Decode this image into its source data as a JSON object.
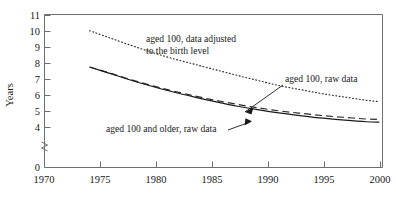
{
  "chart_data": {
    "type": "line",
    "title": "",
    "xlabel": "",
    "ylabel": "Years",
    "xlim": [
      1970,
      2001.5
    ],
    "ylim": [
      3.6,
      11.3
    ],
    "y_axis_break": true,
    "y_break_between": [
      0,
      4
    ],
    "grid": false,
    "legend_position": "inline-annotations",
    "xticks": [
      1970,
      1975,
      1980,
      1985,
      1990,
      1995,
      2000
    ],
    "xtick_labels": [
      "1970",
      "1975",
      "1980",
      "1985",
      "1990",
      "1995",
      "2000"
    ],
    "yticks": [
      0,
      4,
      5,
      6,
      7,
      8,
      9,
      10,
      11
    ],
    "ytick_labels": [
      "0",
      "4",
      "5",
      "6",
      "7",
      "8",
      "9",
      "10",
      "11"
    ],
    "series": [
      {
        "name": "aged 100, data adjusted to the birth level",
        "style": "dotted",
        "x": [
          1974.2,
          1976,
          1978,
          1980,
          1982,
          1984,
          1986,
          1988,
          1990,
          1992,
          1994,
          1996,
          1998,
          2000,
          2001.2
        ],
        "values": [
          10.05,
          9.62,
          9.15,
          8.7,
          8.3,
          7.95,
          7.6,
          7.25,
          6.92,
          6.6,
          6.35,
          6.1,
          5.9,
          5.7,
          5.62
        ]
      },
      {
        "name": "aged 100, raw data",
        "style": "dashed",
        "x": [
          1974.2,
          1976,
          1978,
          1980,
          1982,
          1984,
          1986,
          1988,
          1990,
          1992,
          1994,
          1996,
          1998,
          2000,
          2001.2
        ],
        "values": [
          7.78,
          7.42,
          7.0,
          6.62,
          6.28,
          5.97,
          5.69,
          5.44,
          5.22,
          5.03,
          4.88,
          4.74,
          4.63,
          4.53,
          4.5
        ]
      },
      {
        "name": "aged 100 and older, raw data",
        "style": "solid",
        "x": [
          1974.2,
          1976,
          1978,
          1980,
          1982,
          1984,
          1986,
          1988,
          1990,
          1992,
          1994,
          1996,
          1998,
          2000,
          2001.2
        ],
        "values": [
          7.78,
          7.4,
          6.97,
          6.58,
          6.22,
          5.9,
          5.6,
          5.33,
          5.1,
          4.9,
          4.73,
          4.58,
          4.46,
          4.36,
          4.33
        ]
      }
    ],
    "annotations": [
      {
        "name": "annotation-adjusted",
        "text_lines": [
          "aged 100, data adjusted",
          "to the birth level"
        ],
        "has_arrow": false
      },
      {
        "name": "annotation-raw-100",
        "text_lines": [
          "aged 100, raw data"
        ],
        "has_arrow": true
      },
      {
        "name": "annotation-raw-100-older",
        "text_lines": [
          "aged 100 and older, raw data"
        ],
        "has_arrow": true
      }
    ]
  },
  "axis": {
    "y_title": "Years",
    "y_labels": [
      "11",
      "10",
      "9",
      "8",
      "7",
      "6",
      "5",
      "4",
      "0"
    ],
    "x_labels": [
      "1970",
      "1975",
      "1980",
      "1985",
      "1990",
      "1995",
      "2000"
    ]
  },
  "labels": {
    "adjusted_line1": "aged 100, data adjusted",
    "adjusted_line2": "to the birth level",
    "raw_100": "aged 100, raw data",
    "raw_100_older": "aged 100 and older, raw data"
  },
  "colors": {
    "ink": "#1a1a1a",
    "frame": "#6e6e6e",
    "background": "#ffffff"
  }
}
